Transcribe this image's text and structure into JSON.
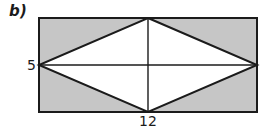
{
  "figure": {
    "part_label": "b)",
    "colors": {
      "background": "#ffffff",
      "rectangle_fill": "#c6c6c6",
      "rhombus_fill": "#ffffff",
      "stroke": "#1b1b1b",
      "text": "#1b1b1b"
    },
    "labels": {
      "height": "5",
      "width": "12"
    },
    "geometry": {
      "rectangle": {
        "x": 39,
        "y": 18,
        "width": 218,
        "height": 94
      },
      "rhombus_vertices": [
        {
          "name": "top",
          "x": 148,
          "y": 18
        },
        {
          "name": "right",
          "x": 257,
          "y": 65
        },
        {
          "name": "bottom",
          "x": 148,
          "y": 112
        },
        {
          "name": "left",
          "x": 39,
          "y": 65
        }
      ],
      "diagonal_horizontal": {
        "x1": 39,
        "y1": 65,
        "x2": 257,
        "y2": 65
      },
      "diagonal_vertical": {
        "x1": 148,
        "y1": 18,
        "x2": 148,
        "y2": 112
      }
    }
  }
}
